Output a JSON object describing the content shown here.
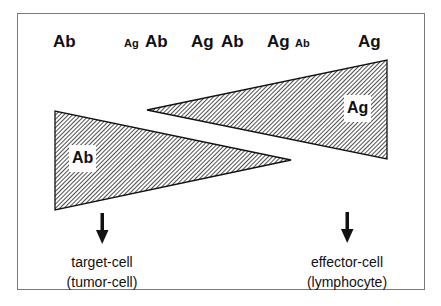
{
  "figure": {
    "top_row": [
      {
        "id": "pos1-ab",
        "text": "Ab",
        "size": "large"
      },
      {
        "id": "pos2-ag",
        "text": "Ag",
        "size": "small"
      },
      {
        "id": "pos2-ab",
        "text": "Ab",
        "size": "large"
      },
      {
        "id": "pos3-ag",
        "text": "Ag",
        "size": "large"
      },
      {
        "id": "pos3-ab",
        "text": "Ab",
        "size": "large"
      },
      {
        "id": "pos4-ag",
        "text": "Ag",
        "size": "large"
      },
      {
        "id": "pos4-ab",
        "text": "Ab",
        "size": "small"
      },
      {
        "id": "pos5-ag",
        "text": "Ag",
        "size": "large"
      }
    ],
    "wedges": {
      "antibody": {
        "label": "Ab",
        "direction": "decreasing left-to-right",
        "fill": "diagonal-hatch"
      },
      "antigen": {
        "label": "Ag",
        "direction": "increasing left-to-right",
        "fill": "diagonal-hatch"
      }
    },
    "arrows": [
      {
        "id": "target-arrow",
        "icon": "down-arrow-icon"
      },
      {
        "id": "effector-arrow",
        "icon": "down-arrow-icon"
      }
    ],
    "bottom_labels": {
      "target": {
        "line1": "target-cell",
        "line2": "(tumor-cell)"
      },
      "effector": {
        "line1": "effector-cell",
        "line2": "(lymphocyte)"
      }
    },
    "colors": {
      "hatch": "#222222",
      "background": "#ffffff",
      "frame_border": "#7a7a7a"
    }
  }
}
